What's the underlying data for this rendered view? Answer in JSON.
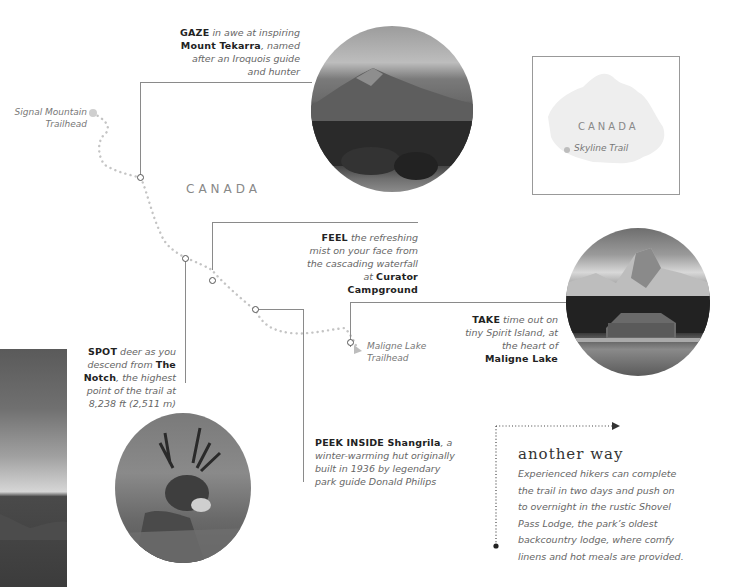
{
  "map": {
    "country_label": "CANADA",
    "start_trailhead": [
      "Signal Mountain",
      "Trailhead"
    ],
    "end_trailhead": [
      "Maligne Lake",
      "Trailhead"
    ]
  },
  "inset_map": {
    "country_label": "CANADA",
    "marker_label": "Skyline Trail"
  },
  "callouts": {
    "gaze": {
      "verb": "GAZE",
      "t1": " in awe at inspiring",
      "bold": "Mount Tekarra",
      "t2": ", named",
      "t3": "after an Iroquois guide",
      "t4": "and hunter"
    },
    "feel": {
      "verb": "FEEL",
      "t1": " the refreshing",
      "t2": "mist on your face from",
      "t3": "the cascading waterfall",
      "t4": "at ",
      "bold1": "Curator",
      "bold2": "Campground"
    },
    "take": {
      "verb": "TAKE",
      "t1": " time out on",
      "t2": "tiny Spirit Island, at",
      "t3": "the heart of",
      "bold": "Maligne Lake"
    },
    "spot": {
      "verb": "SPOT",
      "t1": " deer as you",
      "t2": "descend from ",
      "bold1": "The",
      "bold2": "Notch",
      "t3": ", the highest",
      "t4": "point of the trail at",
      "t5": "8,238 ft (2,511 m)"
    },
    "peek": {
      "verb": "PEEK INSIDE Shangrila",
      "t1": ", a",
      "t2": "winter-warming hut originally",
      "t3": "built in 1936 by legendary",
      "t4": "park guide Donald Philips"
    }
  },
  "sidebar": {
    "title": "another way",
    "body": [
      "Experienced hikers can complete",
      "the trail in two days and push on",
      "to overnight in the rustic Shovel",
      "Pass Lodge, the park’s oldest",
      "backcountry lodge, where comfy",
      "linens and hot meals are provided."
    ]
  },
  "photos": {
    "mountain": "Mount Tekarra photo",
    "lake": "Maligne Lake boathouse photo",
    "deer": "Mule deer photo",
    "strip": "Mountain ridge photo"
  },
  "colors": {
    "leader_line": "#8a8a8a",
    "trail_dots": "#c4c4c4",
    "text_bold": "#222222",
    "text_italic": "#666666"
  }
}
